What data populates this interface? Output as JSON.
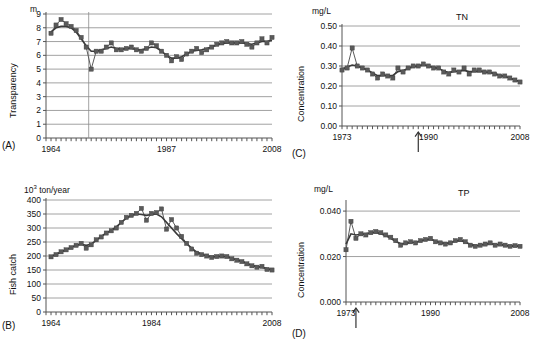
{
  "figure": {
    "title": "",
    "panels": [
      "A",
      "B",
      "C",
      "D"
    ]
  },
  "panelA": {
    "tag": "(A)",
    "unit": "m",
    "ylabel": "Transparency",
    "yticks": [
      "0",
      "1",
      "2",
      "3",
      "4",
      "5",
      "6",
      "7",
      "8",
      "9"
    ],
    "xticks": [
      "1964",
      "1987",
      "2008"
    ],
    "series_label": ""
  },
  "panelB": {
    "tag": "(B)",
    "unit_prefix": "10",
    "unit_sup": "3",
    "unit_suffix": " ton/year",
    "ylabel": "Fish catch",
    "yticks": [
      "0",
      "50",
      "100",
      "150",
      "200",
      "250",
      "300",
      "350",
      "400"
    ],
    "xticks": [
      "1964",
      "1984",
      "2008"
    ],
    "series_label": ""
  },
  "panelC": {
    "tag": "(C)",
    "unit": "mg/L",
    "ylabel": "Concentration",
    "series_label": "TN",
    "yticks": [
      "0.00",
      "0.10",
      "0.20",
      "0.30",
      "0.40",
      "0.50"
    ],
    "xticks": [
      "1973",
      "1990",
      "2008"
    ]
  },
  "panelD": {
    "tag": "(D)",
    "unit": "mg/L",
    "ylabel": "Concentration",
    "series_label": "TP",
    "yticks": [
      "0.000",
      "0.020",
      "0.040"
    ],
    "xticks": [
      "1973",
      "1990",
      "2008"
    ]
  },
  "chart_data": [
    {
      "panel": "A",
      "type": "line",
      "title": "",
      "xlabel": "",
      "ylabel": "Transparency",
      "unit": "m",
      "xlim": [
        1963,
        2008
      ],
      "ylim": [
        0,
        9
      ],
      "ytick_step": 1,
      "grid": true,
      "legend": "none",
      "annotations": [
        {
          "type": "vline",
          "x": 1971.5
        }
      ],
      "x": [
        1964,
        1965,
        1966,
        1967,
        1968,
        1969,
        1970,
        1971,
        1972,
        1973,
        1974,
        1975,
        1976,
        1977,
        1978,
        1979,
        1980,
        1981,
        1982,
        1983,
        1984,
        1985,
        1986,
        1987,
        1988,
        1989,
        1990,
        1991,
        1992,
        1993,
        1994,
        1995,
        1996,
        1997,
        1998,
        1999,
        2000,
        2001,
        2002,
        2003,
        2004,
        2005,
        2006,
        2007,
        2008
      ],
      "series": [
        {
          "name": "observed",
          "marker": "square",
          "values": [
            7.6,
            8.2,
            8.6,
            8.3,
            8.1,
            7.8,
            7.3,
            6.6,
            5.0,
            6.3,
            6.3,
            6.6,
            6.9,
            6.4,
            6.4,
            6.5,
            6.6,
            6.4,
            6.3,
            6.5,
            6.9,
            6.7,
            6.3,
            6.0,
            5.6,
            5.9,
            5.7,
            6.1,
            6.3,
            6.5,
            6.2,
            6.4,
            6.6,
            6.8,
            6.9,
            7.0,
            6.9,
            6.9,
            7.0,
            6.8,
            6.6,
            6.9,
            7.2,
            6.9,
            7.3
          ]
        },
        {
          "name": "smoothed",
          "marker": "none",
          "values": [
            7.7,
            8.0,
            8.1,
            8.1,
            8.0,
            7.7,
            7.2,
            6.7,
            6.3,
            6.3,
            6.4,
            6.5,
            6.6,
            6.5,
            6.45,
            6.5,
            6.5,
            6.4,
            6.4,
            6.5,
            6.6,
            6.55,
            6.3,
            6.0,
            5.8,
            5.8,
            5.9,
            6.1,
            6.3,
            6.35,
            6.4,
            6.5,
            6.6,
            6.75,
            6.85,
            6.9,
            6.9,
            6.9,
            6.9,
            6.85,
            6.8,
            6.9,
            7.0,
            7.0,
            7.1
          ]
        }
      ]
    },
    {
      "panel": "B",
      "type": "line",
      "title": "",
      "xlabel": "",
      "ylabel": "Fish catch",
      "unit": "10^3 ton/year",
      "xlim": [
        1963,
        2008
      ],
      "ylim": [
        0,
        400
      ],
      "ytick_step": 50,
      "grid": true,
      "legend": "none",
      "annotations": [],
      "x": [
        1964,
        1965,
        1966,
        1967,
        1968,
        1969,
        1970,
        1971,
        1972,
        1973,
        1974,
        1975,
        1976,
        1977,
        1978,
        1979,
        1980,
        1981,
        1982,
        1983,
        1984,
        1985,
        1986,
        1987,
        1988,
        1989,
        1990,
        1991,
        1992,
        1993,
        1994,
        1995,
        1996,
        1997,
        1998,
        1999,
        2000,
        2001,
        2002,
        2003,
        2004,
        2005,
        2006,
        2007,
        2008
      ],
      "series": [
        {
          "name": "observed",
          "marker": "square",
          "values": [
            197,
            205,
            215,
            222,
            230,
            238,
            245,
            228,
            240,
            258,
            268,
            282,
            290,
            300,
            320,
            338,
            345,
            352,
            370,
            328,
            352,
            355,
            368,
            296,
            330,
            300,
            270,
            245,
            225,
            210,
            205,
            200,
            195,
            198,
            200,
            198,
            190,
            185,
            180,
            172,
            165,
            160,
            163,
            152,
            150
          ]
        },
        {
          "name": "smoothed",
          "marker": "none",
          "values": [
            198,
            206,
            214,
            222,
            230,
            238,
            242,
            238,
            242,
            256,
            270,
            282,
            292,
            304,
            320,
            335,
            345,
            350,
            348,
            345,
            348,
            350,
            340,
            320,
            300,
            280,
            262,
            244,
            228,
            214,
            206,
            200,
            197,
            198,
            199,
            197,
            192,
            186,
            180,
            173,
            167,
            162,
            160,
            155,
            151
          ]
        }
      ]
    },
    {
      "panel": "C",
      "type": "line",
      "title": "TN",
      "xlabel": "",
      "ylabel": "Concentration",
      "unit": "mg/L",
      "xlim": [
        1973,
        2008
      ],
      "ylim": [
        0.0,
        0.5
      ],
      "ytick_step": 0.1,
      "grid": true,
      "legend": "none",
      "annotations": [
        {
          "type": "arrow",
          "x": 1988,
          "direction": "up"
        }
      ],
      "x": [
        1973,
        1974,
        1975,
        1976,
        1977,
        1978,
        1979,
        1980,
        1981,
        1982,
        1983,
        1984,
        1985,
        1986,
        1987,
        1988,
        1989,
        1990,
        1991,
        1992,
        1993,
        1994,
        1995,
        1996,
        1997,
        1998,
        1999,
        2000,
        2001,
        2002,
        2003,
        2004,
        2005,
        2006,
        2007,
        2008
      ],
      "series": [
        {
          "name": "observed",
          "marker": "square",
          "values": [
            0.28,
            0.29,
            0.39,
            0.3,
            0.29,
            0.28,
            0.26,
            0.24,
            0.26,
            0.25,
            0.24,
            0.29,
            0.27,
            0.29,
            0.3,
            0.3,
            0.31,
            0.3,
            0.29,
            0.29,
            0.27,
            0.26,
            0.28,
            0.27,
            0.29,
            0.26,
            0.28,
            0.28,
            0.27,
            0.27,
            0.26,
            0.25,
            0.25,
            0.24,
            0.23,
            0.22
          ]
        },
        {
          "name": "smoothed",
          "marker": "none",
          "values": [
            0.285,
            0.295,
            0.305,
            0.3,
            0.29,
            0.28,
            0.265,
            0.252,
            0.253,
            0.25,
            0.253,
            0.272,
            0.278,
            0.288,
            0.296,
            0.3,
            0.305,
            0.3,
            0.293,
            0.288,
            0.275,
            0.268,
            0.272,
            0.274,
            0.278,
            0.272,
            0.272,
            0.273,
            0.27,
            0.268,
            0.262,
            0.254,
            0.248,
            0.24,
            0.23,
            0.222
          ]
        }
      ]
    },
    {
      "panel": "D",
      "type": "line",
      "title": "TP",
      "xlabel": "",
      "ylabel": "Concentration",
      "unit": "mg/L",
      "xlim": [
        1973,
        2008
      ],
      "ylim": [
        0.0,
        0.044
      ],
      "ytick_step": 0.02,
      "grid": true,
      "legend": "none",
      "annotations": [
        {
          "type": "arrow",
          "x": 1975,
          "direction": "up"
        }
      ],
      "x": [
        1973,
        1974,
        1975,
        1976,
        1977,
        1978,
        1979,
        1980,
        1981,
        1982,
        1983,
        1984,
        1985,
        1986,
        1987,
        1988,
        1989,
        1990,
        1991,
        1992,
        1993,
        1994,
        1995,
        1996,
        1997,
        1998,
        1999,
        2000,
        2001,
        2002,
        2003,
        2004,
        2005,
        2006,
        2007,
        2008
      ],
      "series": [
        {
          "name": "observed",
          "marker": "square",
          "values": [
            0.023,
            0.0355,
            0.028,
            0.03,
            0.0295,
            0.0305,
            0.031,
            0.0305,
            0.0295,
            0.0285,
            0.027,
            0.025,
            0.026,
            0.0265,
            0.026,
            0.027,
            0.0275,
            0.028,
            0.0265,
            0.026,
            0.0255,
            0.026,
            0.027,
            0.0275,
            0.0265,
            0.025,
            0.0245,
            0.025,
            0.0255,
            0.026,
            0.025,
            0.0255,
            0.025,
            0.0245,
            0.0248,
            0.0245
          ]
        },
        {
          "name": "smoothed",
          "marker": "none",
          "values": [
            0.0255,
            0.03,
            0.0295,
            0.0298,
            0.03,
            0.0305,
            0.0306,
            0.03,
            0.0292,
            0.028,
            0.0266,
            0.0257,
            0.0258,
            0.0262,
            0.0263,
            0.0268,
            0.0274,
            0.0275,
            0.0268,
            0.0261,
            0.0258,
            0.0261,
            0.0268,
            0.027,
            0.0264,
            0.0253,
            0.0248,
            0.025,
            0.0254,
            0.0256,
            0.0253,
            0.0252,
            0.0249,
            0.0246,
            0.0247,
            0.0245
          ]
        }
      ]
    }
  ],
  "colors": {
    "marker": "#5a5a5a",
    "line": "#3a3a3a",
    "grid": "#8a8a8a",
    "axis": "#555555",
    "text": "#111111"
  }
}
